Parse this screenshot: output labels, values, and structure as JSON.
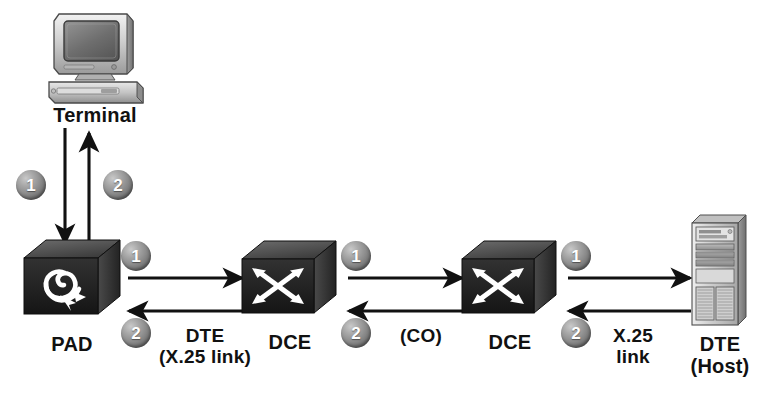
{
  "diagram": {
    "background": "#ffffff",
    "badge_color": "#7a7a7a",
    "device_fill": "#2b2b2b",
    "line_color": "#111111"
  },
  "nodes": {
    "terminal": {
      "label": "Terminal",
      "icon": "crt-terminal-icon"
    },
    "pad": {
      "label": "PAD",
      "icon": "spiral-arrow-icon"
    },
    "dce_left": {
      "label": "DCE",
      "icon": "switch-cross-arrows-icon"
    },
    "dce_right": {
      "label": "DCE",
      "icon": "switch-cross-arrows-icon"
    },
    "host": {
      "label_line1": "DTE",
      "label_line2": "(Host)",
      "icon": "tower-server-icon"
    }
  },
  "links": {
    "terminal_pad": {
      "label_line1": "",
      "label_line2": ""
    },
    "pad_dce": {
      "label_line1": "DTE",
      "label_line2": "(X.25 link)"
    },
    "dce_dce": {
      "label_line1": "(CO)",
      "label_line2": ""
    },
    "dce_host": {
      "label_line1": "X.25",
      "label_line2": "link"
    }
  },
  "badges": {
    "step_one": "1",
    "step_two": "2",
    "terminal_down": "1",
    "terminal_up": "2",
    "pad_out": "1",
    "pad_in": "2",
    "dce_left_out": "1",
    "dce_left_in": "2",
    "dce_right_out": "1",
    "dce_right_in": "2"
  }
}
